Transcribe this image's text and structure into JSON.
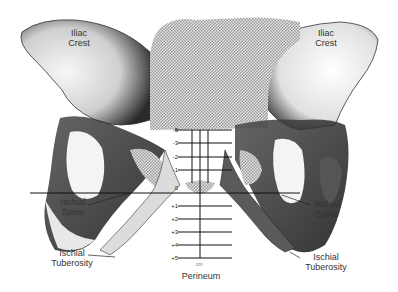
{
  "figure": {
    "labels": {
      "iliac_crest_left": [
        "Iliac",
        "Crest"
      ],
      "iliac_crest_right": [
        "Iliac",
        "Crest"
      ],
      "ischial_spine_left": [
        "Ischial",
        "Spine"
      ],
      "ischial_spine_right": [
        "Ischial",
        "Spine"
      ],
      "ischial_tuberosity_left": [
        "Ischial",
        "Tuberosity"
      ],
      "ischial_tuberosity_right": [
        "Ischial",
        "Tuberosity"
      ],
      "perineum": "Perineum"
    },
    "scale": {
      "unit": "cm",
      "ticks": [
        "-5",
        "-3",
        "-2",
        "-1",
        "0",
        "+1",
        "+2",
        "+3",
        "+4",
        "+5"
      ]
    },
    "colors": {
      "bone_dark": "#1a1a1a",
      "bone_mid": "#7a7a7a",
      "bone_light": "#f2f2f2",
      "stipple": "#bdbdbd",
      "background": "#ffffff"
    }
  }
}
